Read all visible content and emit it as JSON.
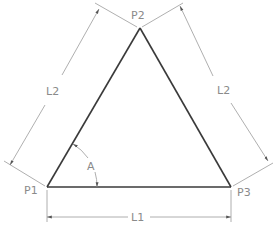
{
  "diagram": {
    "type": "equilateral-triangle-dimension-drawing",
    "points": {
      "p1": {
        "label": "P1",
        "x": 47,
        "y": 187
      },
      "p2": {
        "label": "P2",
        "x": 140,
        "y": 28
      },
      "p3": {
        "label": "P3",
        "x": 231,
        "y": 187
      }
    },
    "dimensions": {
      "base": {
        "label": "L1"
      },
      "left_side": {
        "label": "L2"
      },
      "right_side": {
        "label": "L2"
      },
      "angle": {
        "label": "A"
      }
    },
    "colors": {
      "outline": "#3a3a3a",
      "dimension": "#9a9a9a",
      "text": "#8a8a8a"
    }
  }
}
